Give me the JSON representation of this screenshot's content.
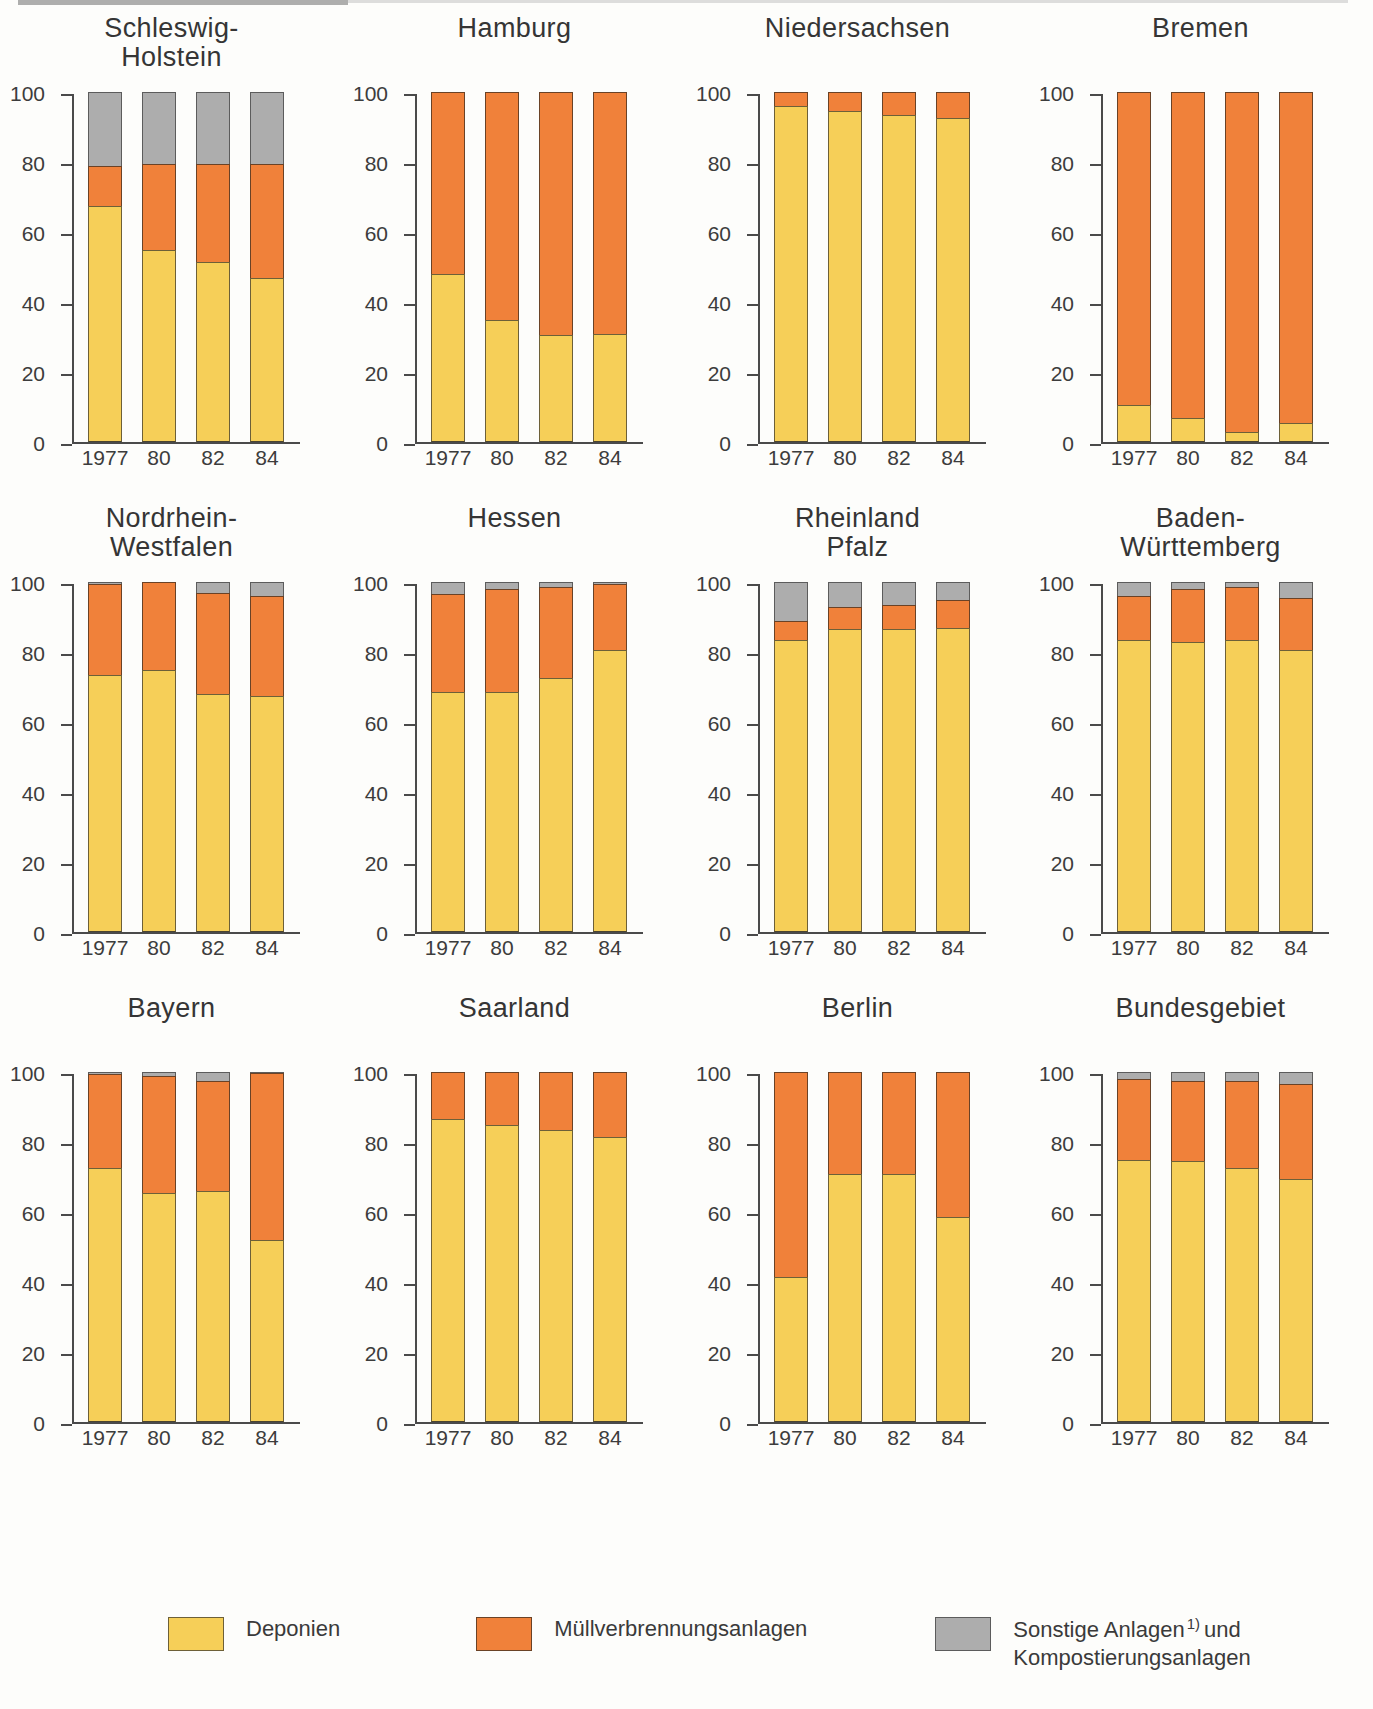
{
  "colors": {
    "deponien": "#f6cf58",
    "muellverbrennung": "#f0813a",
    "sonstige": "#adadad",
    "axis": "#4a4a4a",
    "text": "#3a3a3a",
    "background": "#fdfdfb"
  },
  "axis": {
    "y_ticks": [
      "100",
      "80",
      "60",
      "40",
      "20",
      "0"
    ],
    "x_ticks": [
      "1977",
      "80",
      "82",
      "84"
    ]
  },
  "legend": {
    "items": [
      {
        "key": "deponien",
        "label": "Deponien",
        "footnote": "",
        "label2": ""
      },
      {
        "key": "muellverbrennung",
        "label": "Müllverbrennungsanlagen",
        "footnote": "",
        "label2": ""
      },
      {
        "key": "sonstige",
        "label": "Sonstige Anlagen",
        "footnote": "1)",
        "label_tail": "und",
        "label2": "Kompostierungsanlagen"
      }
    ]
  },
  "chart_data": {
    "type": "bar",
    "subtype": "stacked-100-small-multiples",
    "categories": [
      "1977",
      "80",
      "82",
      "84"
    ],
    "series_names": [
      "Deponien",
      "Müllverbrennungsanlagen",
      "Sonstige Anlagen und Kompostierungsanlagen"
    ],
    "ylim": [
      0,
      100
    ],
    "yticks": [
      0,
      20,
      40,
      60,
      80,
      100
    ],
    "ylabel": "",
    "xlabel": "",
    "grid": false,
    "legend_position": "bottom",
    "panels": [
      {
        "title": "Schleswig-\nHolstein",
        "series": [
          {
            "name": "Deponien",
            "values": [
              67.5,
              55,
              51.5,
              47
            ]
          },
          {
            "name": "Müllverbrennungsanlagen",
            "values": [
              11.5,
              24.5,
              28,
              32.5
            ]
          },
          {
            "name": "Sonstige Anlagen und Kompostierungsanlagen",
            "values": [
              21,
              20.5,
              20.5,
              20.5
            ]
          }
        ]
      },
      {
        "title": "Hamburg",
        "series": [
          {
            "name": "Deponien",
            "values": [
              48,
              35,
              30.5,
              31
            ]
          },
          {
            "name": "Müllverbrennungsanlagen",
            "values": [
              52,
              65,
              69.5,
              69
            ]
          },
          {
            "name": "Sonstige Anlagen und Kompostierungsanlagen",
            "values": [
              0,
              0,
              0,
              0
            ]
          }
        ]
      },
      {
        "title": "Niedersachsen",
        "series": [
          {
            "name": "Deponien",
            "values": [
              96,
              94.5,
              93.5,
              92.5
            ]
          },
          {
            "name": "Müllverbrennungsanlagen",
            "values": [
              4,
              5.5,
              6.5,
              7.5
            ]
          },
          {
            "name": "Sonstige Anlagen und Kompostierungsanlagen",
            "values": [
              0,
              0,
              0,
              0
            ]
          }
        ]
      },
      {
        "title": "Bremen",
        "series": [
          {
            "name": "Deponien",
            "values": [
              10.5,
              7,
              3,
              5.5
            ]
          },
          {
            "name": "Müllverbrennungsanlagen",
            "values": [
              89.5,
              93,
              97,
              94.5
            ]
          },
          {
            "name": "Sonstige Anlagen und Kompostierungsanlagen",
            "values": [
              0,
              0,
              0,
              0
            ]
          }
        ]
      },
      {
        "title": "Nordrhein-\nWestfalen",
        "series": [
          {
            "name": "Deponien",
            "values": [
              73.5,
              75,
              68,
              67.5
            ]
          },
          {
            "name": "Müllverbrennungsanlagen",
            "values": [
              26,
              25,
              29,
              28.5
            ]
          },
          {
            "name": "Sonstige Anlagen und Kompostierungsanlagen",
            "values": [
              0.5,
              0,
              3,
              4
            ]
          }
        ]
      },
      {
        "title": "Hessen",
        "series": [
          {
            "name": "Deponien",
            "values": [
              68.5,
              68.5,
              72.5,
              80.5
            ]
          },
          {
            "name": "Müllverbrennungsanlagen",
            "values": [
              28,
              29.5,
              26,
              19
            ]
          },
          {
            "name": "Sonstige Anlagen und Kompostierungsanlagen",
            "values": [
              3.5,
              2,
              1.5,
              0.5
            ]
          }
        ]
      },
      {
        "title": "Rheinland\nPfalz",
        "series": [
          {
            "name": "Deponien",
            "values": [
              83.5,
              86.5,
              86.5,
              87
            ]
          },
          {
            "name": "Müllverbrennungsanlagen",
            "values": [
              5.5,
              6.5,
              7,
              8
            ]
          },
          {
            "name": "Sonstige Anlagen und Kompostierungsanlagen",
            "values": [
              11,
              7,
              6.5,
              5
            ]
          }
        ]
      },
      {
        "title": "Baden-\nWürttemberg",
        "series": [
          {
            "name": "Deponien",
            "values": [
              83.5,
              83,
              83.5,
              80.5
            ]
          },
          {
            "name": "Müllverbrennungsanlagen",
            "values": [
              12.5,
              15,
              15,
              15
            ]
          },
          {
            "name": "Sonstige Anlagen und Kompostierungsanlagen",
            "values": [
              4,
              2,
              1.5,
              4.5
            ]
          }
        ]
      },
      {
        "title": "Bayern",
        "series": [
          {
            "name": "Deponien",
            "values": [
              72.5,
              65.5,
              66,
              52
            ]
          },
          {
            "name": "Müllverbrennungsanlagen",
            "values": [
              27,
              33.5,
              31.5,
              47.8
            ]
          },
          {
            "name": "Sonstige Anlagen und Kompostierungsanlagen",
            "values": [
              0.5,
              1,
              2.5,
              0.2
            ]
          }
        ]
      },
      {
        "title": "Saarland",
        "series": [
          {
            "name": "Deponien",
            "values": [
              86.5,
              85,
              83.5,
              81.5
            ]
          },
          {
            "name": "Müllverbrennungsanlagen",
            "values": [
              13.5,
              15,
              16.5,
              18.5
            ]
          },
          {
            "name": "Sonstige Anlagen und Kompostierungsanlagen",
            "values": [
              0,
              0,
              0,
              0
            ]
          }
        ]
      },
      {
        "title": "Berlin",
        "series": [
          {
            "name": "Deponien",
            "values": [
              41.5,
              71,
              71,
              58.5
            ]
          },
          {
            "name": "Müllverbrennungsanlagen",
            "values": [
              58.5,
              29,
              29,
              41.5
            ]
          },
          {
            "name": "Sonstige Anlagen und Kompostierungsanlagen",
            "values": [
              0,
              0,
              0,
              0
            ]
          }
        ]
      },
      {
        "title": "Bundesgebiet",
        "series": [
          {
            "name": "Deponien",
            "values": [
              75,
              74.5,
              72.5,
              69.5
            ]
          },
          {
            "name": "Müllverbrennungsanlagen",
            "values": [
              23,
              23,
              25,
              27
            ]
          },
          {
            "name": "Sonstige Anlagen und Kompostierungsanlagen",
            "values": [
              2,
              2.5,
              2.5,
              3.5
            ]
          }
        ]
      }
    ]
  }
}
